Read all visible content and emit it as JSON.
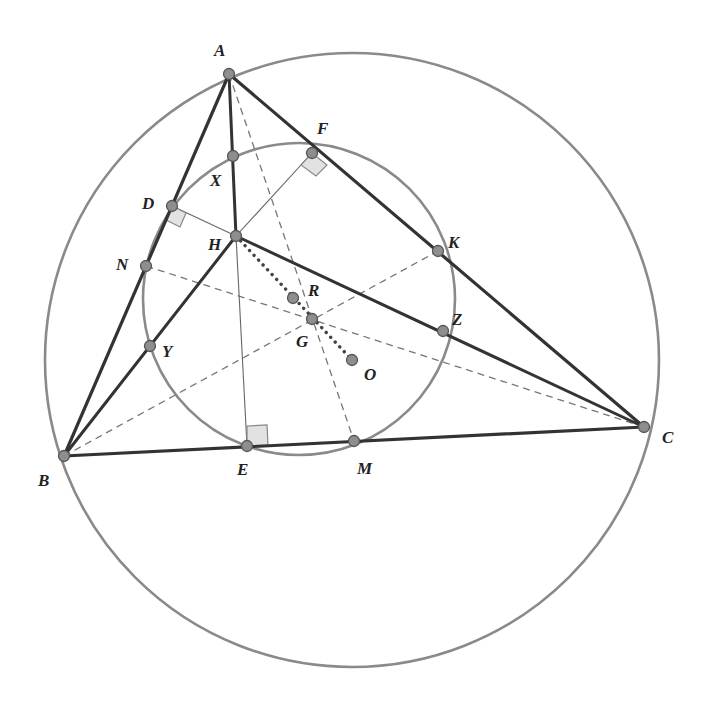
{
  "figure": {
    "circles": {
      "circumcircle": {
        "cx": 352,
        "cy": 360,
        "r": 307,
        "color": "#8a8a8a"
      },
      "nine_point_circle": {
        "cx": 299,
        "cy": 299,
        "r": 156,
        "color": "#8a8a8a"
      }
    },
    "points": {
      "A": {
        "x": 229,
        "y": 74,
        "label": "A",
        "lx": 214,
        "ly": 56
      },
      "B": {
        "x": 64,
        "y": 456,
        "label": "B",
        "lx": 38,
        "ly": 486
      },
      "C": {
        "x": 644,
        "y": 427,
        "label": "C",
        "lx": 662,
        "ly": 443
      },
      "D": {
        "x": 172,
        "y": 206,
        "label": "D",
        "lx": 142,
        "ly": 209
      },
      "E": {
        "x": 247,
        "y": 446,
        "label": "E",
        "lx": 237,
        "ly": 475
      },
      "F": {
        "x": 312,
        "y": 153,
        "label": "F",
        "lx": 317,
        "ly": 134
      },
      "H": {
        "x": 236,
        "y": 236,
        "label": "H",
        "lx": 208,
        "ly": 250
      },
      "X": {
        "x": 233,
        "y": 156,
        "label": "X",
        "lx": 210,
        "ly": 186
      },
      "Y": {
        "x": 150,
        "y": 346,
        "label": "Y",
        "lx": 162,
        "ly": 357
      },
      "Z": {
        "x": 443,
        "y": 331,
        "label": "Z",
        "lx": 452,
        "ly": 325
      },
      "K": {
        "x": 438,
        "y": 251,
        "label": "K",
        "lx": 448,
        "ly": 248
      },
      "N": {
        "x": 146,
        "y": 266,
        "label": "N",
        "lx": 116,
        "ly": 270
      },
      "M": {
        "x": 354,
        "y": 441,
        "label": "M",
        "lx": 357,
        "ly": 474
      },
      "R": {
        "x": 293,
        "y": 298,
        "label": "R",
        "lx": 308,
        "ly": 296
      },
      "G": {
        "x": 312,
        "y": 319,
        "label": "G",
        "lx": 296,
        "ly": 347
      },
      "O": {
        "x": 352,
        "y": 360,
        "label": "O",
        "lx": 364,
        "ly": 380
      }
    },
    "labels": [
      "A",
      "B",
      "C",
      "D",
      "E",
      "F",
      "H",
      "X",
      "Y",
      "Z",
      "K",
      "N",
      "M",
      "R",
      "G",
      "O"
    ]
  }
}
